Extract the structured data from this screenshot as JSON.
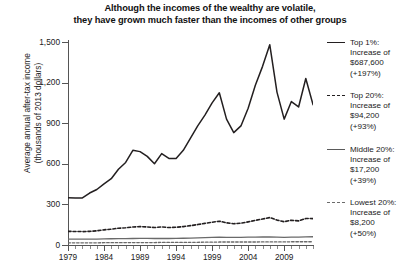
{
  "title": {
    "line1": "Although the incomes of the wealthy are volatile,",
    "line2": "they have grown much faster than the incomes of other groups"
  },
  "axis": {
    "y_title_line1": "Average annual after-tax income",
    "y_title_line2": "(thousands of 2013 dollars)",
    "y_ticks": [
      "0",
      "300",
      "600",
      "900",
      "1,200",
      "1,500"
    ],
    "x_ticks": [
      "1979",
      "1984",
      "1989",
      "1994",
      "1999",
      "2004",
      "2009"
    ]
  },
  "legend": [
    {
      "name": "Top 1%:",
      "l2": "Increase of",
      "l3": "$687,600",
      "l4": "(+197%)",
      "style": "solid-thick"
    },
    {
      "name": "Top 20%:",
      "l2": "Increase of",
      "l3": "$94,200",
      "l4": "(+93%)",
      "style": "dashed"
    },
    {
      "name": "Middle 20%:",
      "l2": "Increase of",
      "l3": "$17,200",
      "l4": "(+39%)",
      "style": "solid-thin"
    },
    {
      "name": "Lowest 20%:",
      "l2": "Increase of",
      "l3": "$8,200",
      "l4": "(+50%)",
      "style": "dashed-thin"
    }
  ],
  "chart_data": {
    "type": "line",
    "title": "Although the incomes of the wealthy are volatile, they have grown much faster than the incomes of other groups",
    "xlabel": "",
    "ylabel": "Average annual after-tax income (thousands of 2013 dollars)",
    "xlim": [
      1979,
      2013
    ],
    "ylim": [
      0,
      1500
    ],
    "grid": false,
    "legend_position": "right",
    "x": [
      1979,
      1980,
      1981,
      1982,
      1983,
      1984,
      1985,
      1986,
      1987,
      1988,
      1989,
      1990,
      1991,
      1992,
      1993,
      1994,
      1995,
      1996,
      1997,
      1998,
      1999,
      2000,
      2001,
      2002,
      2003,
      2004,
      2005,
      2006,
      2007,
      2008,
      2009,
      2010,
      2011,
      2012,
      2013
    ],
    "series": [
      {
        "name": "Top 1%",
        "style": "solid",
        "values": [
          349,
          348,
          348,
          384,
          410,
          452,
          490,
          560,
          610,
          700,
          690,
          655,
          600,
          675,
          640,
          640,
          700,
          790,
          880,
          960,
          1050,
          1125,
          930,
          830,
          880,
          1010,
          1180,
          1320,
          1480,
          1130,
          930,
          1060,
          1020,
          1230,
          1037
        ]
      },
      {
        "name": "Top 20%",
        "style": "dashed",
        "values": [
          101,
          100,
          99,
          101,
          105,
          112,
          117,
          124,
          127,
          133,
          136,
          133,
          129,
          133,
          129,
          131,
          136,
          143,
          151,
          160,
          168,
          176,
          164,
          157,
          161,
          171,
          182,
          192,
          203,
          184,
          172,
          183,
          178,
          196,
          195
        ]
      },
      {
        "name": "Middle 20%",
        "style": "solid",
        "values": [
          44,
          43,
          43,
          43,
          44,
          45,
          46,
          47,
          47,
          48,
          49,
          49,
          48,
          48,
          48,
          49,
          50,
          51,
          53,
          55,
          56,
          58,
          57,
          56,
          57,
          58,
          58,
          59,
          60,
          58,
          57,
          58,
          58,
          60,
          61
        ]
      },
      {
        "name": "Lowest 20%",
        "style": "dashed",
        "values": [
          16,
          16,
          16,
          16,
          16,
          17,
          17,
          17,
          18,
          18,
          18,
          18,
          18,
          19,
          19,
          19,
          19,
          20,
          20,
          21,
          21,
          22,
          22,
          22,
          22,
          22,
          22,
          23,
          23,
          23,
          23,
          24,
          24,
          24,
          24
        ]
      }
    ]
  }
}
